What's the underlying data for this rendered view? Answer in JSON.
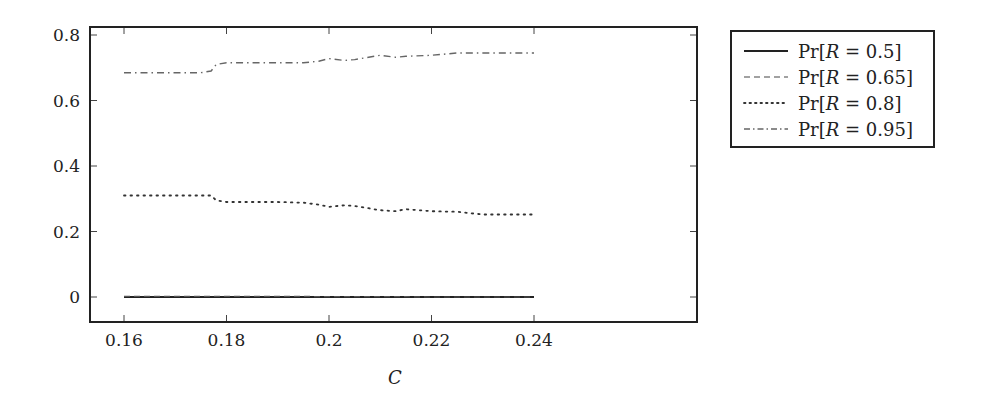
{
  "chart_data": {
    "type": "line",
    "title": "",
    "xlabel": "C",
    "ylabel": "",
    "xlim": [
      0.153,
      0.248
    ],
    "ylim": [
      -0.08,
      0.82
    ],
    "xticks": [
      0.16,
      0.18,
      0.2,
      0.22,
      0.24
    ],
    "xtick_labels": [
      "0.16",
      "0.18",
      "0.2",
      "0.22",
      "0.24"
    ],
    "yticks": [
      0,
      0.2,
      0.4,
      0.6,
      0.8
    ],
    "ytick_labels": [
      "0",
      "0.2",
      "0.4",
      "0.6",
      "0.8"
    ],
    "grid": false,
    "legend_position": "outside right, top",
    "x": [
      0.16,
      0.165,
      0.17,
      0.175,
      0.177,
      0.178,
      0.18,
      0.185,
      0.19,
      0.195,
      0.198,
      0.2,
      0.203,
      0.205,
      0.21,
      0.213,
      0.215,
      0.22,
      0.225,
      0.23,
      0.235,
      0.24
    ],
    "series": [
      {
        "name": "Pr[R = 0.5]",
        "style": "solid",
        "values": [
          0.0,
          0.0,
          0.0,
          0.0,
          0.0,
          0.0,
          0.0,
          0.0,
          0.0,
          0.0,
          0.0,
          0.0,
          0.0,
          0.0,
          0.0,
          0.0,
          0.0,
          0.0,
          0.0,
          0.0,
          0.0,
          0.0
        ]
      },
      {
        "name": "Pr[R = 0.65]",
        "style": "dashed",
        "values": [
          0.002,
          0.002,
          0.002,
          0.002,
          0.002,
          0.002,
          0.002,
          0.002,
          0.002,
          0.002,
          0.001,
          0.001,
          0.001,
          0.001,
          0.001,
          0.001,
          0.001,
          0.0,
          0.0,
          0.0,
          0.0,
          0.0
        ]
      },
      {
        "name": "Pr[R = 0.8]",
        "style": "dotted",
        "values": [
          0.31,
          0.31,
          0.31,
          0.31,
          0.31,
          0.295,
          0.29,
          0.29,
          0.29,
          0.288,
          0.282,
          0.275,
          0.28,
          0.278,
          0.265,
          0.262,
          0.268,
          0.262,
          0.26,
          0.252,
          0.252,
          0.252
        ]
      },
      {
        "name": "Pr[R = 0.95]",
        "style": "dash-dot",
        "values": [
          0.685,
          0.685,
          0.685,
          0.685,
          0.69,
          0.71,
          0.715,
          0.715,
          0.715,
          0.715,
          0.72,
          0.728,
          0.722,
          0.725,
          0.738,
          0.732,
          0.735,
          0.738,
          0.745,
          0.745,
          0.745,
          0.745
        ]
      }
    ]
  },
  "legend": {
    "entries": [
      {
        "prefix": "Pr[",
        "var": "R",
        "suffix": " = 0.5]"
      },
      {
        "prefix": "Pr[",
        "var": "R",
        "suffix": " = 0.65]"
      },
      {
        "prefix": "Pr[",
        "var": "R",
        "suffix": " = 0.8]"
      },
      {
        "prefix": "Pr[",
        "var": "R",
        "suffix": " = 0.95]"
      }
    ]
  },
  "colors": {
    "axis": "#222222",
    "line": "#333333",
    "dashdot": "#666666"
  }
}
